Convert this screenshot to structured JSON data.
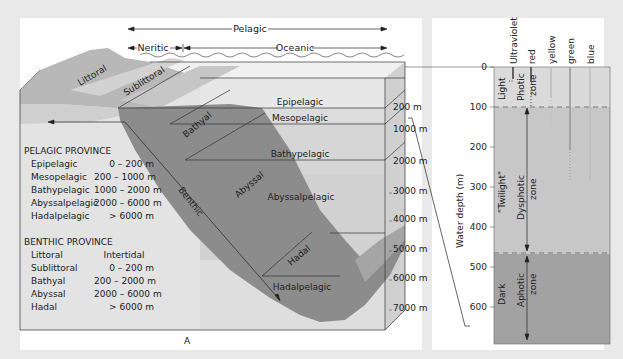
{
  "panel_a": {
    "caption": "A",
    "top_labels": {
      "pelagic": "Pelagic",
      "neritic": "Neritic",
      "oceanic": "Oceanic"
    },
    "benthic_zones_on_slope": [
      "Littoral",
      "Sublittoral",
      "Bathyal",
      "Abyssal",
      "Hadal"
    ],
    "benthic_arrow_label": "Benthic",
    "pelagic_zones_in_water": [
      "Epipelagic",
      "Mesopelagic",
      "Bathypelagic",
      "Abyssalpelagic",
      "Hadalpelagic"
    ],
    "depth_scale": [
      "200 m",
      "1000 m",
      "2000 m",
      "3000 m",
      "4000 m",
      "5000 m",
      "6000 m",
      "7000 m"
    ],
    "legend": {
      "pelagic_title": "PELAGIC PROVINCE",
      "pelagic_rows": [
        {
          "name": "Epipelagic",
          "range": "0 – 200 m"
        },
        {
          "name": "Mesopelagic",
          "range": "200 – 1000 m"
        },
        {
          "name": "Bathypelagic",
          "range": "1000 – 2000 m"
        },
        {
          "name": "Abyssalpelagic",
          "range": "2000 – 6000 m"
        },
        {
          "name": "Hadalpelagic",
          "range": "> 6000 m"
        }
      ],
      "benthic_title": "BENTHIC PROVINCE",
      "benthic_rows": [
        {
          "name": "Littoral",
          "range": "Intertidal"
        },
        {
          "name": "Sublittoral",
          "range": "0 – 200 m"
        },
        {
          "name": "Bathyal",
          "range": "200 – 2000 m"
        },
        {
          "name": "Abyssal",
          "range": "2000 – 6000 m"
        },
        {
          "name": "Hadal",
          "range": "> 6000 m"
        }
      ]
    }
  },
  "panel_b": {
    "caption": "B",
    "y_axis_label": "Water depth (m)",
    "y_ticks": [
      "0",
      "100",
      "200",
      "300",
      "400",
      "500",
      "600"
    ],
    "wavelength_labels": [
      "Ultraviolet",
      "red",
      "yellow",
      "green",
      "blue"
    ],
    "light_regimes": [
      "Light",
      "\"Twilight\"",
      "Dark"
    ],
    "zones": [
      "Photic zone",
      "Dysphotic zone",
      "Aphotic zone"
    ],
    "zone_words": {
      "photic": "Photic",
      "dysphotic": "Dysphotic",
      "aphotic": "Aphotic",
      "zone": "zone"
    }
  },
  "colors": {
    "page_bg": "#e9e9e9",
    "panel_bg": "#ffffff",
    "seafloor": "#8a8a8a",
    "water_light": "#d9d9d9",
    "water_mid": "#c9c9c9",
    "land": "#b5b5b5",
    "dark_zone": "#9c9c9c"
  }
}
